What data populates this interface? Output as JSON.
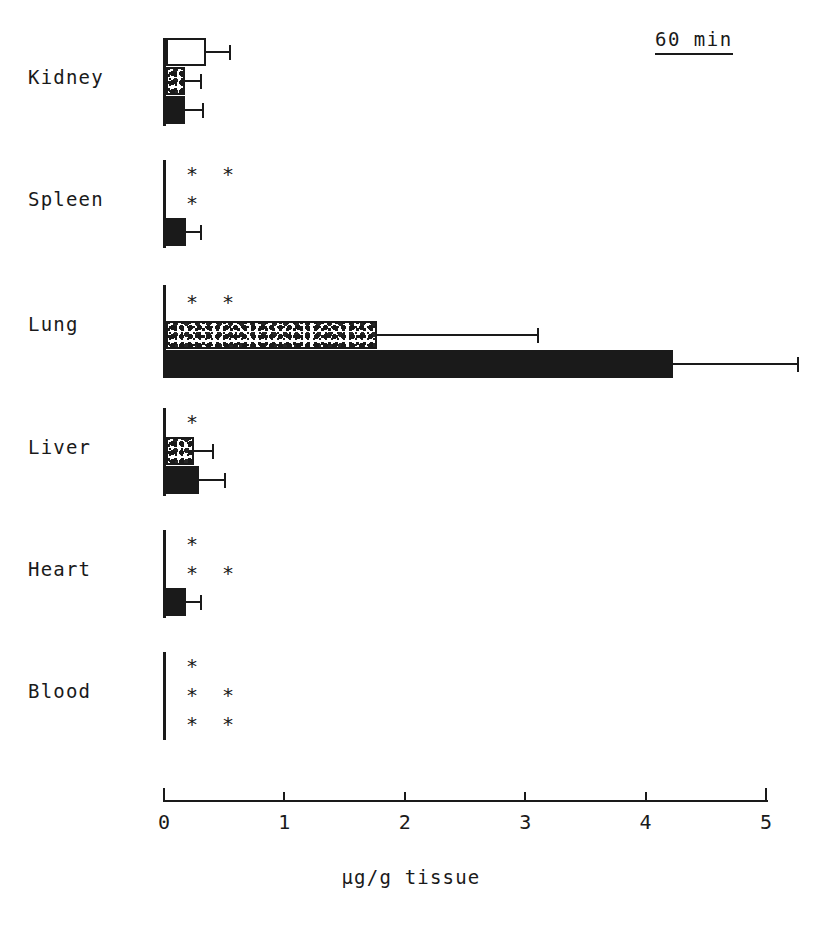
{
  "annotation": {
    "timepoint": "60 min"
  },
  "chart_data": {
    "type": "bar",
    "orientation": "horizontal",
    "title": "",
    "subtitle": "60 min",
    "xlabel": "µg/g tissue",
    "ylabel": "",
    "xlim": [
      0,
      5
    ],
    "xticks": [
      0,
      1,
      2,
      3,
      4,
      5
    ],
    "xticklabels": [
      "0",
      "1",
      "2",
      "3",
      "4",
      "5"
    ],
    "grid": false,
    "legend": false,
    "categories": [
      "Kidney",
      "Spleen",
      "Lung",
      "Liver",
      "Heart",
      "Blood"
    ],
    "series": [
      {
        "name": "open",
        "fill": "open",
        "values": [
          0.33,
          0.0,
          0.0,
          0.0,
          0.0,
          0.0
        ],
        "errors": [
          0.19,
          0.0,
          0.0,
          0.0,
          0.0,
          0.0
        ],
        "significance": [
          "",
          "**",
          "**",
          "*",
          "*",
          "*"
        ]
      },
      {
        "name": "stippled",
        "fill": "stipple",
        "values": [
          0.16,
          0.0,
          1.75,
          0.23,
          0.0,
          0.0
        ],
        "errors": [
          0.12,
          0.0,
          1.33,
          0.15,
          0.0,
          0.0
        ],
        "significance": [
          "",
          "*",
          "",
          "",
          "**",
          "**"
        ]
      },
      {
        "name": "solid",
        "fill": "filled",
        "values": [
          0.16,
          0.17,
          4.21,
          0.27,
          0.17,
          0.0
        ],
        "errors": [
          0.14,
          0.11,
          1.03,
          0.21,
          0.11,
          0.0
        ],
        "significance": [
          "",
          "",
          "",
          "",
          "",
          "**"
        ]
      }
    ],
    "groups": [
      {
        "label": "Kidney",
        "top": 38,
        "label_y": 78,
        "axis_top": 38,
        "axis_height": 88,
        "bars": [
          {
            "series": "open",
            "fill": "open",
            "y": 38,
            "value": 0.33,
            "error": 0.19,
            "sig": ""
          },
          {
            "series": "stippled",
            "fill": "stipple",
            "y": 67,
            "value": 0.16,
            "error": 0.12,
            "sig": ""
          },
          {
            "series": "solid",
            "fill": "filled",
            "y": 96,
            "value": 0.16,
            "error": 0.14,
            "sig": ""
          }
        ]
      },
      {
        "label": "Spleen",
        "top": 160,
        "label_y": 200,
        "axis_top": 160,
        "axis_height": 88,
        "bars": [
          {
            "series": "open",
            "fill": "open",
            "y": 160,
            "value": 0.0,
            "error": 0.0,
            "sig": "* *"
          },
          {
            "series": "stippled",
            "fill": "stipple",
            "y": 189,
            "value": 0.0,
            "error": 0.0,
            "sig": "*"
          },
          {
            "series": "solid",
            "fill": "filled",
            "y": 218,
            "value": 0.17,
            "error": 0.11,
            "sig": ""
          }
        ]
      },
      {
        "label": "Lung",
        "top": 285,
        "label_y": 325,
        "axis_top": 285,
        "axis_height": 93,
        "bars": [
          {
            "series": "open",
            "fill": "open",
            "y": 288,
            "value": 0.0,
            "error": 0.0,
            "sig": "* *"
          },
          {
            "series": "stippled",
            "fill": "stipple",
            "y": 321,
            "value": 1.75,
            "error": 1.33,
            "sig": ""
          },
          {
            "series": "solid",
            "fill": "filled",
            "y": 350,
            "value": 4.21,
            "error": 1.03,
            "sig": ""
          }
        ]
      },
      {
        "label": "Liver",
        "top": 408,
        "label_y": 448,
        "axis_top": 408,
        "axis_height": 88,
        "bars": [
          {
            "series": "open",
            "fill": "open",
            "y": 408,
            "value": 0.0,
            "error": 0.0,
            "sig": "*"
          },
          {
            "series": "stippled",
            "fill": "stipple",
            "y": 437,
            "value": 0.23,
            "error": 0.15,
            "sig": ""
          },
          {
            "series": "solid",
            "fill": "filled",
            "y": 466,
            "value": 0.27,
            "error": 0.21,
            "sig": ""
          }
        ]
      },
      {
        "label": "Heart",
        "top": 530,
        "label_y": 570,
        "axis_top": 530,
        "axis_height": 88,
        "bars": [
          {
            "series": "open",
            "fill": "open",
            "y": 530,
            "value": 0.0,
            "error": 0.0,
            "sig": "*"
          },
          {
            "series": "stippled",
            "fill": "stipple",
            "y": 559,
            "value": 0.0,
            "error": 0.0,
            "sig": "* *"
          },
          {
            "series": "solid",
            "fill": "filled",
            "y": 588,
            "value": 0.17,
            "error": 0.11,
            "sig": ""
          }
        ]
      },
      {
        "label": "Blood",
        "top": 652,
        "label_y": 692,
        "axis_top": 652,
        "axis_height": 88,
        "bars": [
          {
            "series": "open",
            "fill": "open",
            "y": 652,
            "value": 0.0,
            "error": 0.0,
            "sig": "*"
          },
          {
            "series": "stippled",
            "fill": "stipple",
            "y": 681,
            "value": 0.0,
            "error": 0.0,
            "sig": "* *"
          },
          {
            "series": "solid",
            "fill": "filled",
            "y": 710,
            "value": 0.0,
            "error": 0.0,
            "sig": "* *"
          }
        ]
      }
    ]
  },
  "axis_geometry": {
    "x_origin_px": 163,
    "px_per_unit": 120.4,
    "bar_height_px": 28
  }
}
